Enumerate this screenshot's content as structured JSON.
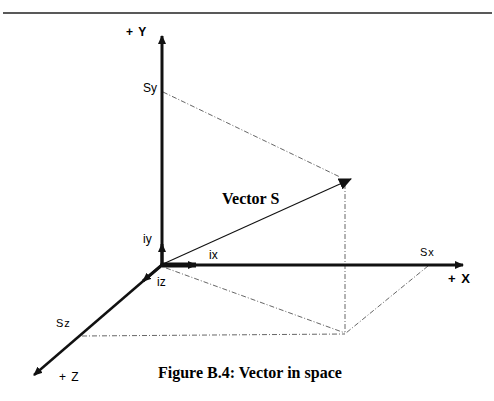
{
  "figure": {
    "caption": "Figure B.4: Vector in space",
    "vector_label": "Vector S",
    "axes": {
      "y_label": "+ Y",
      "x_label": "+ X",
      "z_label": "+ Z"
    },
    "components": {
      "sx": "Sx",
      "sy": "Sy",
      "sz": "Sz"
    },
    "unit_vectors": {
      "ix": "ix",
      "iy": "iy",
      "iz": "iz"
    },
    "colors": {
      "line": "#111111",
      "dashed": "#555555",
      "background": "#ffffff"
    }
  }
}
